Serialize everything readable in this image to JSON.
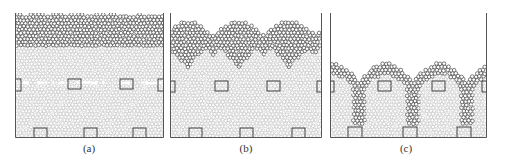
{
  "figure": {
    "panels": [
      {
        "id": "a",
        "label": "(a)",
        "x": 15,
        "width": 149,
        "stage": "initial",
        "dark_layer_top": 0,
        "dark_layer_bottom": 33,
        "band_y": 70,
        "surface": "flat"
      },
      {
        "id": "b",
        "label": "(b)",
        "x": 170,
        "width": 152,
        "stage": "intermediate",
        "surface": "wavy"
      },
      {
        "id": "c",
        "label": "(c)",
        "x": 330,
        "width": 157,
        "stage": "final",
        "surface": "low-wavy"
      }
    ],
    "colors": {
      "frame": "#555555",
      "particle_light": "#b9b9b9",
      "particle_dark": "#444444",
      "background": "#ffffff"
    }
  }
}
